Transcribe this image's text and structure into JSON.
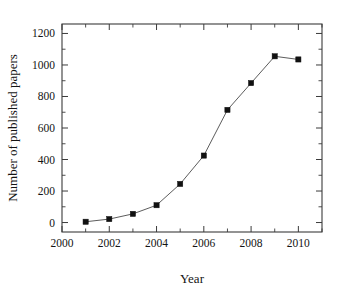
{
  "chart_data": {
    "type": "line",
    "title": "",
    "xlabel": "Year",
    "ylabel": "Number of published papers",
    "x": [
      2001,
      2002,
      2003,
      2004,
      2005,
      2006,
      2007,
      2008,
      2009,
      2010
    ],
    "values": [
      5,
      22,
      55,
      110,
      245,
      425,
      715,
      885,
      1055,
      1035
    ],
    "series": [
      {
        "name": "Number of published papers",
        "x": [
          2001,
          2002,
          2003,
          2004,
          2005,
          2006,
          2007,
          2008,
          2009,
          2010
        ],
        "values": [
          5,
          22,
          55,
          110,
          245,
          425,
          715,
          885,
          1055,
          1035
        ],
        "marker": "filled-square",
        "marker_color": "#111111",
        "line_color": "#4a4a4a"
      }
    ],
    "xlim": [
      2000,
      2011
    ],
    "ylim": [
      -60,
      1260
    ],
    "xticks": [
      2000,
      2002,
      2004,
      2006,
      2008,
      2010
    ],
    "xtick_labels": [
      "2000",
      "2002",
      "2004",
      "2006",
      "2008",
      "2010"
    ],
    "xminor_ticks": [
      2001,
      2003,
      2005,
      2007,
      2009,
      2011
    ],
    "yticks": [
      0,
      200,
      400,
      600,
      800,
      1000,
      1200
    ],
    "ytick_labels": [
      "0",
      "200",
      "400",
      "600",
      "800",
      "1000",
      "1200"
    ],
    "yminor_ticks": [
      100,
      300,
      500,
      700,
      900,
      1100
    ],
    "grid": false,
    "legend": null,
    "frame": "box",
    "tick_direction": "in"
  },
  "figure": {
    "background_color": "#ffffff",
    "axis_color": "#3b3b3b",
    "text_color": "#141414"
  }
}
